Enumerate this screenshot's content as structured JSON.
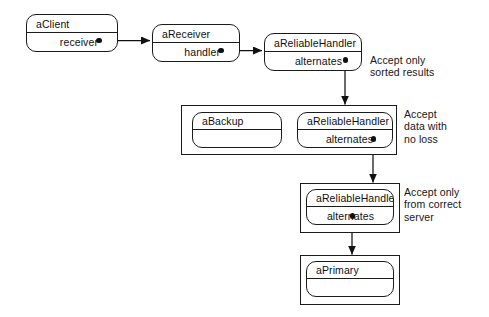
{
  "diagram": {
    "objects": [
      {
        "id": "aClient",
        "name": "aClient",
        "attribute": "receiver"
      },
      {
        "id": "aReceiver",
        "name": "aReceiver",
        "attribute": "handler"
      },
      {
        "id": "aReliableHandler1",
        "name": "aReliableHandler",
        "attribute": "alternates"
      },
      {
        "id": "aBackup",
        "name": "aBackup",
        "attribute": ""
      },
      {
        "id": "aReliableHandler2",
        "name": "aReliableHandler",
        "attribute": "alternates"
      },
      {
        "id": "aReliableHandler3",
        "name": "aReliableHandler",
        "attribute": "alternates"
      },
      {
        "id": "aPrimary",
        "name": "aPrimary",
        "attribute": ""
      }
    ],
    "notes": [
      {
        "id": "note-sorted",
        "text": "Accept only\nsorted results"
      },
      {
        "id": "note-noloss",
        "text": "Accept\ndata with\nno loss"
      },
      {
        "id": "note-correct",
        "text": "Accept only\nfrom correct\nserver"
      }
    ],
    "colors": {
      "stroke": "#1b1b1b",
      "fill": "#ffffff",
      "text": "#101010",
      "background": "#ffffff"
    }
  }
}
